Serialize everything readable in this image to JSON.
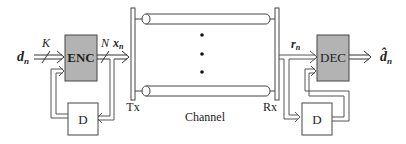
{
  "diagram": {
    "type": "block-diagram",
    "colors": {
      "block_fill": "#b3b3b3",
      "stroke": "#333333",
      "background": "#ffffff"
    },
    "transmitter": {
      "input_label": "d",
      "input_sub": "n",
      "input_width_label": "K",
      "encoder_label": "ENC",
      "output_width_label": "N",
      "output_label": "x",
      "output_sub": "n",
      "delay_label": "D",
      "port_label": "Tx"
    },
    "channel": {
      "label": "Channel",
      "dots": "⋮"
    },
    "receiver": {
      "port_label": "Rx",
      "input_label": "r",
      "input_sub": "n",
      "decoder_label": "DEC",
      "delay_label": "D",
      "output_label": "d̂",
      "output_sub": "n"
    }
  }
}
